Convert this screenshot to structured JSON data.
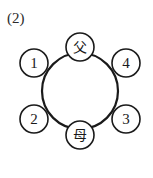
{
  "figure": {
    "panel_label": "(2)",
    "width": 153,
    "height": 178,
    "background_color": "#ffffff",
    "stroke_color": "#1a1a1a"
  },
  "diagram": {
    "type": "ring-seating-chart",
    "main_circle": {
      "name": "table",
      "center_x": 80,
      "center_y": 91,
      "radius": 38,
      "stroke_width": 2.2
    },
    "nodes": [
      {
        "id": "top",
        "label": "父",
        "kind": "kanji",
        "center_x": 80,
        "center_y": 47,
        "radius": 14,
        "stroke_width": 1.6
      },
      {
        "id": "upper-left",
        "label": "1",
        "kind": "number",
        "center_x": 34,
        "center_y": 63,
        "radius": 14,
        "stroke_width": 1.6
      },
      {
        "id": "upper-right",
        "label": "4",
        "kind": "number",
        "center_x": 126,
        "center_y": 63,
        "radius": 14,
        "stroke_width": 1.6
      },
      {
        "id": "lower-left",
        "label": "2",
        "kind": "number",
        "center_x": 34,
        "center_y": 119,
        "radius": 14,
        "stroke_width": 1.6
      },
      {
        "id": "lower-right",
        "label": "3",
        "kind": "number",
        "center_x": 126,
        "center_y": 119,
        "radius": 14,
        "stroke_width": 1.6
      },
      {
        "id": "bottom",
        "label": "母",
        "kind": "kanji",
        "center_x": 80,
        "center_y": 135,
        "radius": 14,
        "stroke_width": 1.6
      }
    ]
  }
}
